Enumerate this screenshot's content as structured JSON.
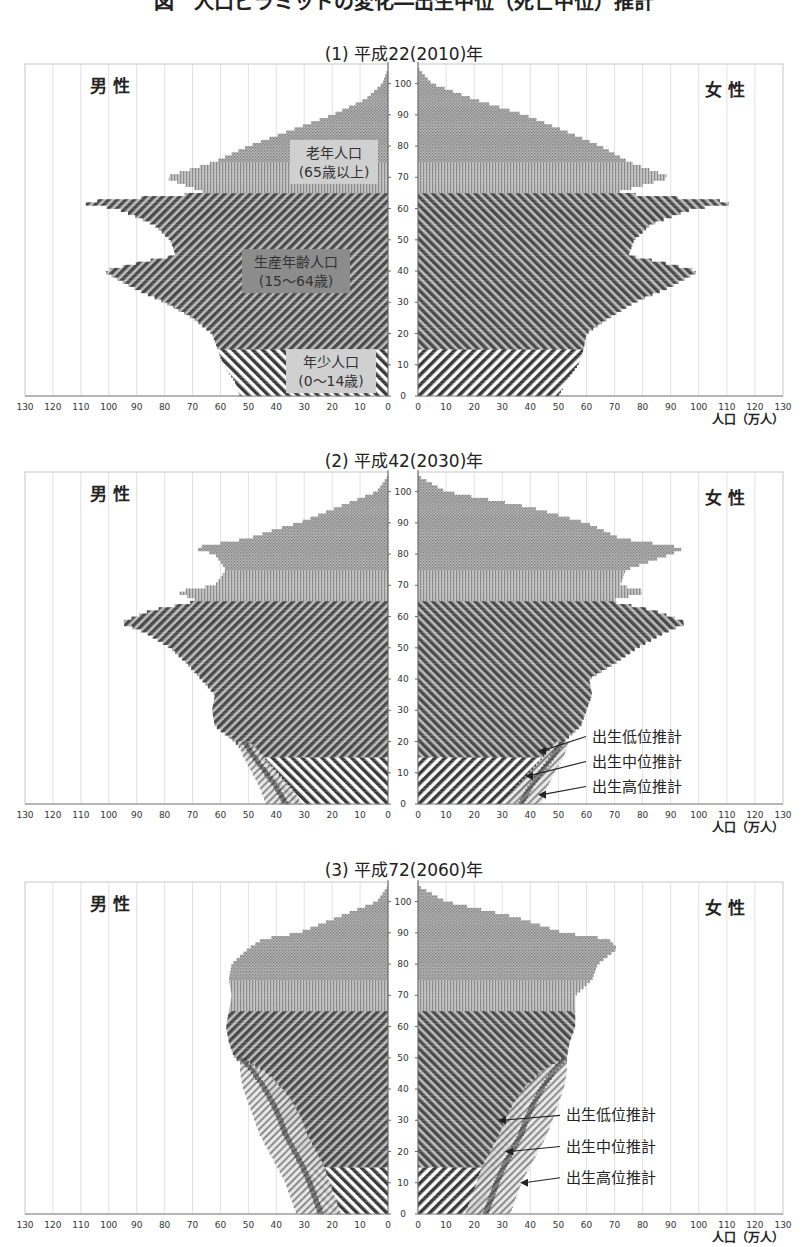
{
  "page": {
    "title": "図　人口ピラミッドの変化―出生中位（死亡中位）推計"
  },
  "axis": {
    "x_ticks_left": [
      130,
      120,
      110,
      100,
      90,
      80,
      70,
      60,
      50,
      40,
      30,
      20,
      10,
      0
    ],
    "x_ticks_right": [
      0,
      10,
      20,
      30,
      40,
      50,
      60,
      70,
      80,
      90,
      100,
      110,
      120,
      130
    ],
    "y_ticks": [
      0,
      10,
      20,
      30,
      40,
      50,
      60,
      70,
      80,
      90,
      100
    ],
    "unit_label": "人口（万人）",
    "male_label": "男 性",
    "female_label": "女 性"
  },
  "colors": {
    "elderly": "#9a9a9a",
    "elderly_75": "#a8a8a8",
    "working": "#4a4a4a",
    "child": "#3a3a3a",
    "box_light": "#d0d0d0",
    "box_dark": "#8c8c8c",
    "grid": "#d8d8d8"
  },
  "chart_data": [
    {
      "type": "bar",
      "subtype": "population_pyramid",
      "title": "(1) 平成22(2010)年",
      "xlabel": "人口（万人）",
      "ylabel": "年齢",
      "xlim": [
        0,
        130
      ],
      "ylim": [
        0,
        105
      ],
      "grid": true,
      "age_groups": [
        {
          "label": "老年人口",
          "sub": "(65歳以上)"
        },
        {
          "label": "生産年齢人口",
          "sub": "(15〜64歳)"
        },
        {
          "label": "年少人口",
          "sub": "(0〜14歳)"
        }
      ],
      "ages": [
        0,
        5,
        10,
        15,
        20,
        25,
        30,
        35,
        40,
        43,
        45,
        50,
        55,
        60,
        62,
        65,
        70,
        75,
        80,
        85,
        90,
        95,
        100,
        105
      ],
      "series": [
        {
          "name": "男性",
          "values": [
            53,
            55,
            59,
            61,
            63,
            70,
            80,
            92,
            102,
            88,
            76,
            78,
            84,
            97,
            112,
            65,
            80,
            62,
            50,
            35,
            20,
            8,
            2,
            0
          ]
        },
        {
          "name": "女性",
          "values": [
            50,
            53,
            57,
            59,
            60,
            68,
            77,
            90,
            100,
            86,
            75,
            77,
            83,
            98,
            115,
            70,
            90,
            75,
            65,
            52,
            38,
            20,
            5,
            0
          ]
        }
      ],
      "annotations": []
    },
    {
      "type": "bar",
      "subtype": "population_pyramid",
      "title": "(2) 平成42(2030)年",
      "xlabel": "人口（万人）",
      "ylabel": "年齢",
      "xlim": [
        0,
        130
      ],
      "ylim": [
        0,
        105
      ],
      "grid": true,
      "ages": [
        0,
        5,
        10,
        15,
        20,
        25,
        30,
        35,
        40,
        45,
        50,
        55,
        58,
        62,
        65,
        68,
        70,
        75,
        80,
        82,
        85,
        88,
        90,
        95,
        100,
        105
      ],
      "series": [
        {
          "name": "男性",
          "values": [
            37,
            40,
            45,
            50,
            55,
            62,
            63,
            62,
            67,
            72,
            78,
            87,
            96,
            85,
            68,
            76,
            62,
            58,
            62,
            70,
            50,
            40,
            32,
            18,
            4,
            0
          ]
        },
        {
          "name": "女性",
          "values": [
            35,
            38,
            43,
            48,
            52,
            58,
            60,
            62,
            61,
            70,
            78,
            88,
            96,
            84,
            68,
            82,
            72,
            74,
            90,
            95,
            72,
            65,
            60,
            40,
            10,
            0
          ]
        }
      ],
      "variants": [
        {
          "name": "出生高位推計",
          "female_values_0_20": [
            44,
            46,
            49,
            52,
            54
          ]
        },
        {
          "name": "出生中位推計",
          "female_values_0_20": [
            37,
            40,
            44,
            48,
            52
          ]
        },
        {
          "name": "出生低位推計",
          "female_values_0_20": [
            31,
            35,
            40,
            45,
            50
          ]
        }
      ],
      "annotations": [
        "出生低位推計",
        "出生中位推計",
        "出生高位推計"
      ]
    },
    {
      "type": "bar",
      "subtype": "population_pyramid",
      "title": "(3) 平成72(2060)年",
      "xlabel": "人口（万人）",
      "ylabel": "年齢",
      "xlim": [
        0,
        130
      ],
      "ylim": [
        0,
        105
      ],
      "grid": true,
      "ages": [
        0,
        5,
        10,
        15,
        20,
        25,
        30,
        35,
        40,
        45,
        50,
        55,
        60,
        65,
        70,
        75,
        80,
        85,
        88,
        90,
        95,
        100,
        105
      ],
      "series": [
        {
          "name": "男性",
          "values": [
            24,
            25,
            27,
            29,
            32,
            35,
            37,
            40,
            43,
            47,
            55,
            57,
            58,
            57,
            56,
            57,
            56,
            50,
            45,
            32,
            18,
            4,
            0
          ]
        },
        {
          "name": "女性",
          "values": [
            23,
            24,
            26,
            28,
            31,
            34,
            36,
            38,
            41,
            46,
            53,
            54,
            56,
            56,
            56,
            62,
            64,
            71,
            68,
            52,
            35,
            10,
            0
          ]
        }
      ],
      "variants": [
        {
          "name": "出生高位推計",
          "female_values_0_50": [
            33,
            35,
            37,
            40,
            43,
            46,
            48,
            50,
            52,
            53,
            53
          ]
        },
        {
          "name": "出生中位推計",
          "female_values_0_50": [
            23,
            24,
            26,
            28,
            31,
            34,
            36,
            38,
            41,
            46,
            53
          ]
        },
        {
          "name": "出生低位推計",
          "female_values_0_50": [
            17,
            19,
            21,
            23,
            26,
            29,
            31,
            34,
            38,
            44,
            53
          ]
        }
      ],
      "annotations": [
        "出生低位推計",
        "出生中位推計",
        "出生高位推計"
      ]
    }
  ],
  "charts_layout": [
    {
      "title_top": 40,
      "svg_top": 44,
      "plot_top": 48,
      "plot_bottom": 397
    },
    {
      "title_top": 454,
      "svg_top": 458,
      "plot_top": 466,
      "plot_bottom": 806
    },
    {
      "title_top": 862,
      "svg_top": 868,
      "plot_top": 878,
      "plot_bottom": 1217
    }
  ]
}
